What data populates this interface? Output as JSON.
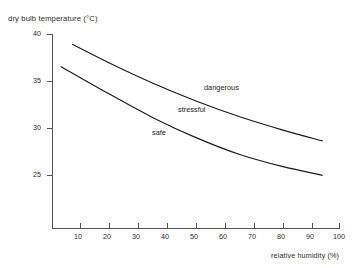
{
  "chart_data": {
    "type": "line",
    "title": "",
    "xlabel": "relative humidity (%)",
    "ylabel": "dry bulb temperature (°C)",
    "xlim": [
      0,
      100
    ],
    "ylim": [
      22.5,
      40
    ],
    "grid": false,
    "legend_position": "inline-annotations",
    "xticks": [
      10,
      20,
      30,
      40,
      50,
      60,
      70,
      80,
      90,
      100
    ],
    "yticks": [
      40,
      35,
      30,
      25
    ],
    "series": [
      {
        "name": "dangerous-stressful boundary",
        "x": [
          7,
          20,
          35,
          50,
          65,
          80,
          94
        ],
        "values": [
          39.1,
          37.4,
          35.6,
          34.0,
          32.6,
          31.4,
          30.4
        ]
      },
      {
        "name": "stressful-safe boundary",
        "x": [
          3,
          20,
          35,
          50,
          65,
          80,
          94
        ],
        "values": [
          37.1,
          34.6,
          32.5,
          30.7,
          29.2,
          28.1,
          27.3
        ]
      }
    ],
    "annotations": [
      {
        "text": "dangerous",
        "x": 59,
        "y": 35.4
      },
      {
        "text": "stressful",
        "x": 50,
        "y": 33.0
      },
      {
        "text": "safe",
        "x": 41,
        "y": 30.5
      }
    ]
  },
  "axes": {
    "y_title": "dry bulb temperature (°C)",
    "x_title": "relative humidity (%)",
    "y_tick_labels": [
      "40",
      "35",
      "30",
      "25"
    ],
    "x_tick_labels": [
      "10",
      "20",
      "30",
      "40",
      "50",
      "60",
      "70",
      "80",
      "90",
      "100"
    ]
  },
  "regions": {
    "dangerous_label": "dangerous",
    "stressful_label": "stressful",
    "safe_label": "safe"
  },
  "colors": {
    "axis": "#555555",
    "curve": "#1a1a1a",
    "text": "#2a2a2a",
    "background": "#ffffff"
  }
}
